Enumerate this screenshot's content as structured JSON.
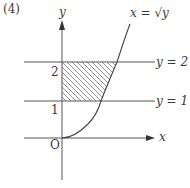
{
  "problem_label": "(4)",
  "axes": {
    "x_label": "x",
    "y_label": "y",
    "origin_label": "O"
  },
  "ticks": {
    "y1": "1",
    "y2": "2"
  },
  "curve": {
    "label": "x = √y",
    "equation": "x = sqrt(y)"
  },
  "lines": [
    {
      "label": "y = 2",
      "y": 2
    },
    {
      "label": "y = 1",
      "y": 1
    }
  ],
  "shaded_region": {
    "description": "region between y=1 and y=2, bounded by y-axis and curve x=√y",
    "y_range": [
      1,
      2
    ],
    "pattern": "diagonal hatching"
  },
  "colors": {
    "stroke": "#555555",
    "hatch": "#777777",
    "background": "#ffffff"
  }
}
